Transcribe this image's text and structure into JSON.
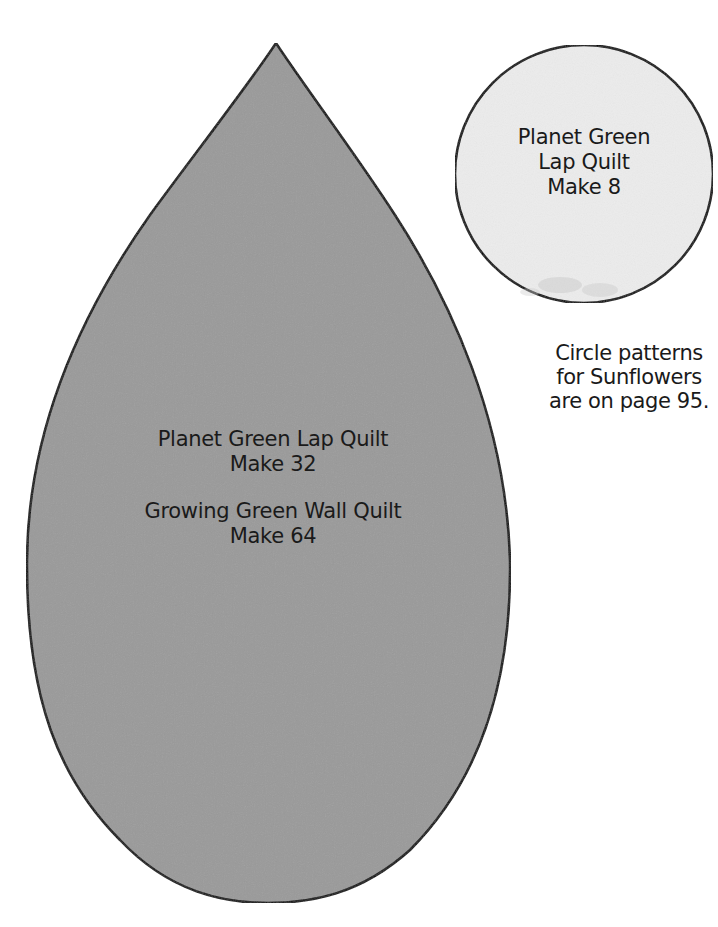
{
  "teardrop_pattern": {
    "fill_color": "#9a9a9a",
    "stroke_color": "#111111",
    "lines": [
      "Planet Green Lap Quilt",
      "Make 32",
      "Growing Green Wall Quilt",
      "Make 64"
    ]
  },
  "circle_pattern": {
    "fill_color": "#ececec",
    "stroke_color": "#111111",
    "lines": [
      "Planet Green",
      "Lap Quilt",
      "Make 8"
    ]
  },
  "note": {
    "lines": [
      "Circle patterns",
      "for Sunflowers",
      "are on page 95."
    ]
  }
}
